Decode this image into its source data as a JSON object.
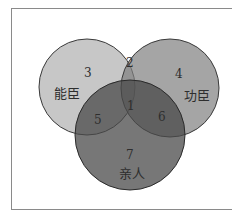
{
  "diagram": {
    "type": "venn",
    "sets": [
      {
        "name": "能臣",
        "color": "#c4c4c4"
      },
      {
        "name": "功臣",
        "color": "#8e8e8e"
      },
      {
        "name": "亲人",
        "color": "#5a5a5a"
      }
    ],
    "regions": [
      {
        "id": "1",
        "label": "1",
        "sets": [
          "能臣",
          "功臣",
          "亲人"
        ]
      },
      {
        "id": "2",
        "label": "2",
        "sets": [
          "能臣",
          "功臣"
        ]
      },
      {
        "id": "3",
        "label": "3",
        "sets": [
          "能臣"
        ]
      },
      {
        "id": "4",
        "label": "4",
        "sets": [
          "功臣"
        ]
      },
      {
        "id": "5",
        "label": "5",
        "sets": [
          "能臣",
          "亲人"
        ]
      },
      {
        "id": "6",
        "label": "6",
        "sets": [
          "功臣",
          "亲人"
        ]
      },
      {
        "id": "7",
        "label": "7",
        "sets": [
          "亲人"
        ]
      }
    ]
  },
  "labels": {
    "left_set": "能臣",
    "right_set": "功臣",
    "bottom_set": "亲人",
    "r1": "1",
    "r2": "2",
    "r3": "3",
    "r4": "4",
    "r5": "5",
    "r6": "6",
    "r7": "7"
  }
}
